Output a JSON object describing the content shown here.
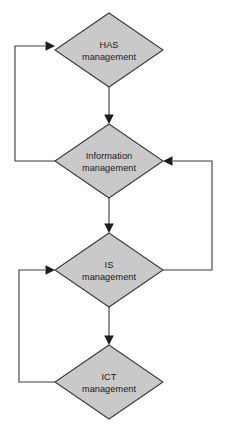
{
  "diagram": {
    "type": "flowchart",
    "background_color": "#ffffff",
    "node_fill_color": "#c9c9c9",
    "node_stroke_color": "#3a3a3a",
    "edge_color": "#3a3a3a",
    "arrow_color": "#1d1d1d",
    "text_color": "#191919",
    "nodes": [
      {
        "id": "has",
        "shape": "diamond",
        "line1": "HAS",
        "line2": "management",
        "cx": 109,
        "cy": 50,
        "rx": 54,
        "ry": 37
      },
      {
        "id": "information",
        "shape": "diamond",
        "line1": "Information",
        "line2": "management",
        "cx": 109,
        "cy": 161,
        "rx": 54,
        "ry": 37
      },
      {
        "id": "is",
        "shape": "diamond",
        "line1": "IS",
        "line2": "management",
        "cx": 109,
        "cy": 270,
        "rx": 54,
        "ry": 37
      },
      {
        "id": "ict",
        "shape": "diamond",
        "line1": "ICT",
        "line2": "management",
        "cx": 109,
        "cy": 382,
        "rx": 54,
        "ry": 37
      }
    ],
    "edges": [
      {
        "id": "has-to-information",
        "from": "has",
        "to": "information",
        "direction": "down",
        "kind": "straight"
      },
      {
        "id": "information-to-is",
        "from": "information",
        "to": "is",
        "direction": "down",
        "kind": "straight"
      },
      {
        "id": "is-to-ict",
        "from": "is",
        "to": "ict",
        "direction": "down",
        "kind": "straight"
      },
      {
        "id": "information-to-has-feedback",
        "from": "information",
        "to": "has",
        "direction": "up",
        "kind": "left-loop"
      },
      {
        "id": "is-to-information-feedback",
        "from": "is",
        "to": "information",
        "direction": "up",
        "kind": "right-loop"
      },
      {
        "id": "ict-to-is-feedback",
        "from": "ict",
        "to": "is",
        "direction": "up",
        "kind": "left-loop"
      }
    ]
  }
}
